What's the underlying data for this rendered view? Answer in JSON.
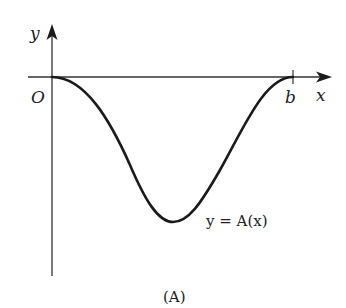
{
  "diagram": {
    "axis_labels": {
      "y": "y",
      "x": "x",
      "origin": "O"
    },
    "tick_label_b": "b",
    "curve_label": "y = A(x)",
    "caption": "(A)",
    "colors": {
      "stroke": "#1a1a1a",
      "background": "#ffffff"
    }
  }
}
